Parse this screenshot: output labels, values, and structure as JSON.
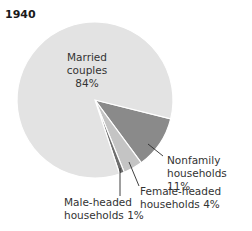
{
  "chart_data": {
    "type": "pie",
    "title": "1940",
    "categories": [
      "Married couples",
      "Nonfamily households",
      "Female-headed households",
      "Male-headed households"
    ],
    "values": [
      84,
      11,
      4,
      1
    ],
    "unit": "%",
    "colors": [
      "#e3e3e3",
      "#8a8a8a",
      "#c4c4c4",
      "#6e6e6e"
    ],
    "labels": [
      {
        "line1": "Married",
        "line2": "couples",
        "line3": "84%"
      },
      {
        "line1": "Nonfamily",
        "line2": "households 11%"
      },
      {
        "line1": "Female-headed",
        "line2": "households 4%"
      },
      {
        "line1": "Male-headed",
        "line2": "households 1%"
      }
    ],
    "legend": "none (direct labels with leader lines)"
  }
}
